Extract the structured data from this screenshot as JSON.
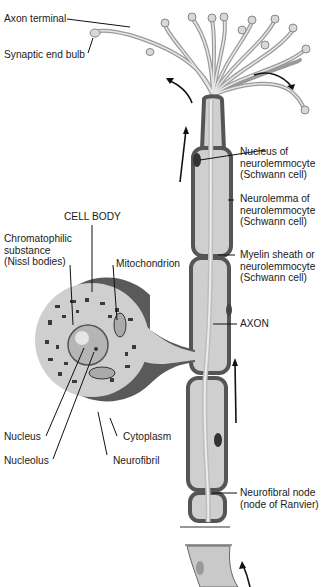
{
  "figure": {
    "labels": {
      "axon_terminal": "Axon terminal",
      "synaptic_end_bulb": "Synaptic end bulb",
      "nucleus_of_neurolemmocyte": "Nucleus of\nneurolemmocyte\n(Schwann cell)",
      "neurolemma": "Neurolemma of\nneurolemmocyte\n(Schwann cell)",
      "myelin_sheath": "Myelin sheath or\nneurolemmocyte\n(Schwann cell)",
      "axon": "AXON",
      "cell_body": "CELL BODY",
      "chromatophilic_substance": "Chromatophilic\nsubstance\n(Nissl bodies)",
      "mitochondrion": "Mitochondrion",
      "nucleus": "Nucleus",
      "nucleolus": "Nucleolus",
      "cytoplasm": "Cytoplasm",
      "neurofibril": "Neurofibril",
      "neurofibral_node": "Neurofibral node\n(node of Ranvier)"
    },
    "colors": {
      "membrane": "#555555",
      "sheath_fill": "#cfcfcf",
      "axon_fill": "#e2e2e2",
      "leader_line": "#111111",
      "arrow": "#111111"
    }
  }
}
